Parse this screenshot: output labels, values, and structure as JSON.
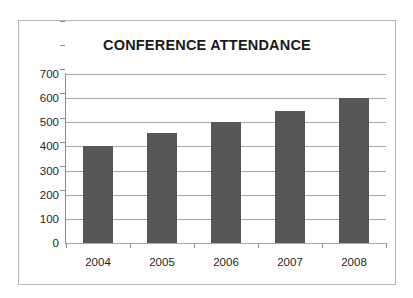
{
  "chart_data": {
    "type": "bar",
    "title": "CONFERENCE ATTENDANCE",
    "categories": [
      "2004",
      "2005",
      "2006",
      "2007",
      "2008"
    ],
    "values": [
      400,
      455,
      500,
      545,
      600
    ],
    "xlabel": "",
    "ylabel": "",
    "ylim": [
      0,
      700
    ],
    "ytick_step": 100,
    "yticks": [
      "700",
      "600",
      "500",
      "400",
      "300",
      "200",
      "100",
      "0"
    ],
    "grid": true,
    "legend": false,
    "bar_color": "#575757",
    "grid_color": "#a9a9a9",
    "axis_color": "#8f8f8f",
    "border_color": "#b4b4b4",
    "background_color": "#ffffff",
    "text_color": "#1f1f1f"
  }
}
